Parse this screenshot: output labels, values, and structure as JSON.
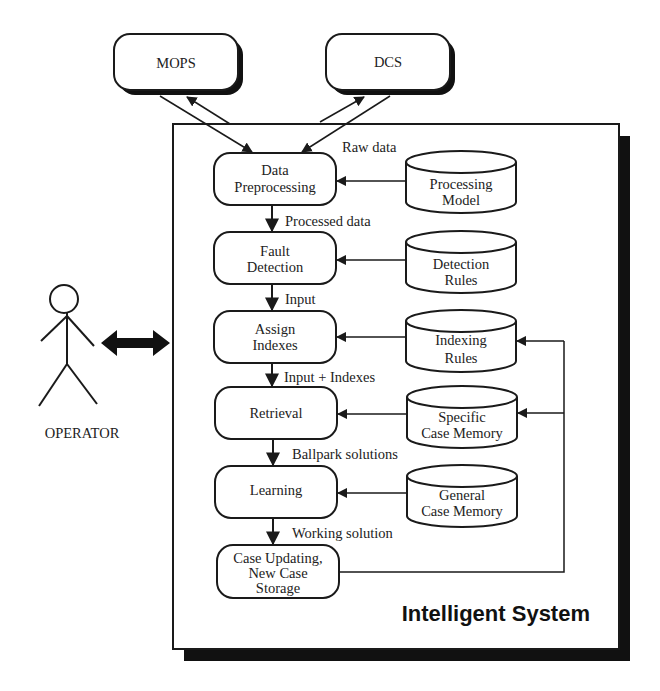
{
  "external": {
    "mops": "MOPS",
    "dcs": "DCS"
  },
  "operator": {
    "label": "OPERATOR"
  },
  "system": {
    "title": "Intelligent System"
  },
  "process": [
    {
      "line1": "Data",
      "line2": "Preprocessing"
    },
    {
      "line1": "Fault",
      "line2": "Detection"
    },
    {
      "line1": "Assign",
      "line2": "Indexes"
    },
    {
      "line1": "Retrieval"
    },
    {
      "line1": "Learning"
    },
    {
      "line1": "Case Updating,",
      "line2": "New Case",
      "line3": "Storage"
    }
  ],
  "stores": [
    {
      "line1": "Processing",
      "line2": "Model"
    },
    {
      "line1": "Detection",
      "line2": "Rules"
    },
    {
      "line1": "Indexing",
      "line2": "Rules"
    },
    {
      "line1": "Specific",
      "line2": "Case Memory"
    },
    {
      "line1": "General",
      "line2": "Case Memory"
    }
  ],
  "flows": {
    "raw": "Raw data",
    "processed": "Processed data",
    "input": "Input",
    "input_indexes": "Input + Indexes",
    "ballpark": "Ballpark solutions",
    "working": "Working solution"
  }
}
